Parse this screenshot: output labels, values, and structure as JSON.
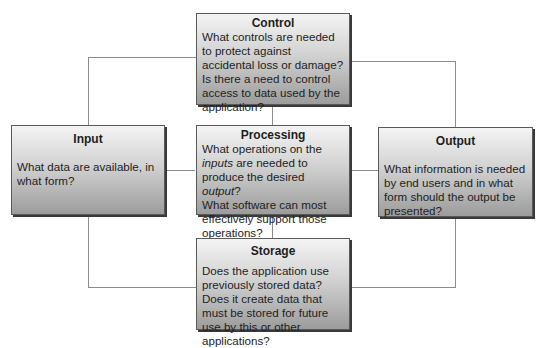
{
  "diagram": {
    "colors": {
      "connector": "#8c8c8c",
      "box_border": "#5a5a5a",
      "box_gradient_top": "#f4f4f4",
      "box_gradient_bottom": "#9c9c9c",
      "text": "#1e1e1e"
    },
    "control": {
      "title": "Control",
      "line1": "What controls are needed to protect against accidental loss or damage?",
      "line2": "Is there a need to control access to data used by the application?"
    },
    "input": {
      "title": "Input",
      "body": "What data are available, in what form?"
    },
    "processing": {
      "title": "Processing",
      "q1_part1": "What operations on the ",
      "q1_italic1": "inputs",
      "q1_part2": " are needed to produce the desired ",
      "q1_italic2": "output",
      "q1_part3": "?",
      "line2": "What software can most effectively support those operations?"
    },
    "output": {
      "title": "Output",
      "body": "What information is needed by end users and in what form should the output be presented?"
    },
    "storage": {
      "title": "Storage",
      "line1": "Does the application use previously stored data?",
      "line2": "Does it create data that must be stored for future use by this or other applications?"
    }
  }
}
